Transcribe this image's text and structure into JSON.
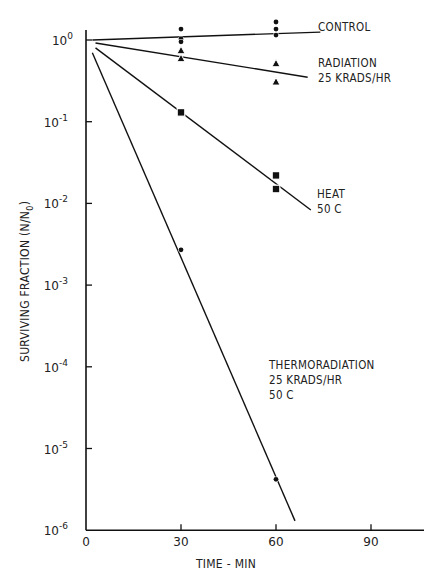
{
  "chart_data": {
    "type": "scatter",
    "title": "",
    "xlabel": "TIME - MIN",
    "ylabel": "SURVIVING FRACTION (N/N0)",
    "ylabel_main": "SURVIVING FRACTION (N/N",
    "ylabel_sub": "0",
    "ylabel_close": ")",
    "yscale": "log",
    "xlim": [
      0,
      110
    ],
    "ylim": [
      1e-06,
      1.5
    ],
    "x_ticks": [
      0,
      30,
      60,
      90
    ],
    "x_tick_labels": [
      "0",
      "30",
      "60",
      "90"
    ],
    "y_ticks": [
      1,
      0.1,
      0.01,
      0.001,
      0.0001,
      1e-05,
      1e-06
    ],
    "y_tick_labels": [
      {
        "base": "10",
        "exp": "0"
      },
      {
        "base": "10",
        "exp": "-1"
      },
      {
        "base": "10",
        "exp": "-2"
      },
      {
        "base": "10",
        "exp": "-3"
      },
      {
        "base": "10",
        "exp": "-4"
      },
      {
        "base": "10",
        "exp": "-5"
      },
      {
        "base": "10",
        "exp": "-6"
      }
    ],
    "grid": false,
    "legend_position": "inline annotations at right of each line",
    "series": [
      {
        "name": "CONTROL",
        "label_lines": [
          "CONTROL"
        ],
        "marker": "circle",
        "points": [
          [
            30,
            1.36
          ],
          [
            30,
            1.03
          ],
          [
            30,
            0.95
          ],
          [
            60,
            1.66
          ],
          [
            60,
            1.36
          ],
          [
            60,
            1.15
          ]
        ],
        "fit_line": [
          [
            2,
            1.0
          ],
          [
            74,
            1.25
          ]
        ]
      },
      {
        "name": "RADIATION 25 KRADS/HR",
        "label_lines": [
          "RADIATION",
          "25 KRADS/HR"
        ],
        "marker": "triangle",
        "points": [
          [
            30,
            0.75
          ],
          [
            30,
            0.6
          ],
          [
            60,
            0.52
          ],
          [
            60,
            0.31
          ]
        ],
        "fit_line": [
          [
            3,
            0.92
          ],
          [
            70,
            0.35
          ]
        ]
      },
      {
        "name": "HEAT 50 C",
        "label_lines": [
          "HEAT",
          "50 C"
        ],
        "marker": "square",
        "points": [
          [
            30,
            0.13
          ],
          [
            60,
            0.022
          ],
          [
            60,
            0.015
          ]
        ],
        "fit_line": [
          [
            3,
            0.8
          ],
          [
            71,
            0.0083
          ]
        ]
      },
      {
        "name": "THERMORADIATION 25 KRADS/HR 50 C",
        "label_lines": [
          "THERMORADIATION",
          "25 KRADS/HR",
          " 50 C"
        ],
        "marker": "circle",
        "points": [
          [
            30,
            0.0027
          ],
          [
            60,
            4.2e-06
          ]
        ],
        "fit_line": [
          [
            2,
            0.7
          ],
          [
            66,
            1.3e-06
          ]
        ]
      }
    ]
  }
}
